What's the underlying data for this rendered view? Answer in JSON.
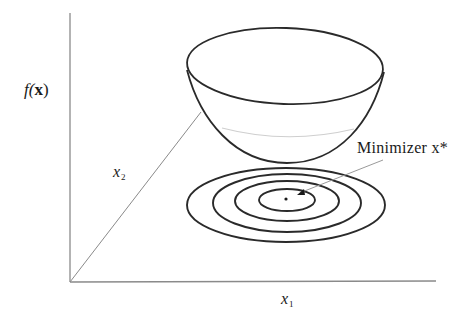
{
  "figure": {
    "labels": {
      "f_prefix": "f(",
      "f_bold": "x",
      "f_suffix": ")",
      "x2_base": "x",
      "x2_sub": "2",
      "x1_base": "x",
      "x1_sub": "1",
      "minimizer": "Minimizer x*"
    },
    "axes": {
      "origin": [
        70,
        282
      ],
      "vertical_top": [
        70,
        13
      ],
      "horizontal_end": [
        436,
        281
      ],
      "diagonal_end": [
        201,
        112
      ]
    },
    "bowl": {
      "rim_center": [
        285,
        66
      ],
      "rim_rx": 98,
      "rim_ry": 38,
      "bottom": [
        287,
        163
      ],
      "faint_contour_y": 136
    },
    "contours": {
      "center": [
        286,
        200
      ],
      "ellipses": [
        {
          "rx": 99,
          "ry": 37
        },
        {
          "rx": 74,
          "ry": 29
        },
        {
          "rx": 52,
          "ry": 20
        },
        {
          "rx": 28,
          "ry": 11
        }
      ],
      "minimizer_point": [
        286,
        199
      ]
    },
    "arrow": {
      "from": [
        383,
        160
      ],
      "to": [
        300,
        193
      ]
    },
    "colors": {
      "stroke": "#2a2a2a",
      "axis": "#8a8a8a",
      "faint": "#c8c8c8",
      "background": "#ffffff"
    }
  }
}
